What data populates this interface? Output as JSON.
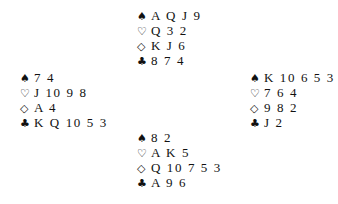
{
  "hands": {
    "north": {
      "spades": {
        "symbol": "♠",
        "cards": "A Q J 9"
      },
      "hearts": {
        "symbol": "♡",
        "cards": "Q 3 2"
      },
      "diamonds": {
        "symbol": "◇",
        "cards": "K J 6"
      },
      "clubs": {
        "symbol": "♣",
        "cards": "8 7 4"
      }
    },
    "west": {
      "spades": {
        "symbol": "♠",
        "cards": "7 4"
      },
      "hearts": {
        "symbol": "♡",
        "cards": "J 10 9 8"
      },
      "diamonds": {
        "symbol": "◇",
        "cards": "A 4"
      },
      "clubs": {
        "symbol": "♣",
        "cards": "K Q 10 5 3"
      }
    },
    "east": {
      "spades": {
        "symbol": "♠",
        "cards": "K 10 6 5 3"
      },
      "hearts": {
        "symbol": "♡",
        "cards": "7 6 4"
      },
      "diamonds": {
        "symbol": "◇",
        "cards": "9 8 2"
      },
      "clubs": {
        "symbol": "♣",
        "cards": "J 2"
      }
    },
    "south": {
      "spades": {
        "symbol": "♠",
        "cards": "8 2"
      },
      "hearts": {
        "symbol": "♡",
        "cards": "A K 5"
      },
      "diamonds": {
        "symbol": "◇",
        "cards": "Q 10 7 5 3"
      },
      "clubs": {
        "symbol": "♣",
        "cards": "A 9 6"
      }
    }
  }
}
